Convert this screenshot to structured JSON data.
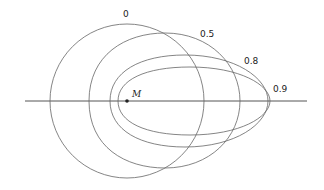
{
  "diagram": {
    "point_label": "M",
    "curves": [
      {
        "label": "0"
      },
      {
        "label": "0.5"
      },
      {
        "label": "0.8"
      },
      {
        "label": "0.9"
      }
    ],
    "stroke_color": "#555555"
  }
}
